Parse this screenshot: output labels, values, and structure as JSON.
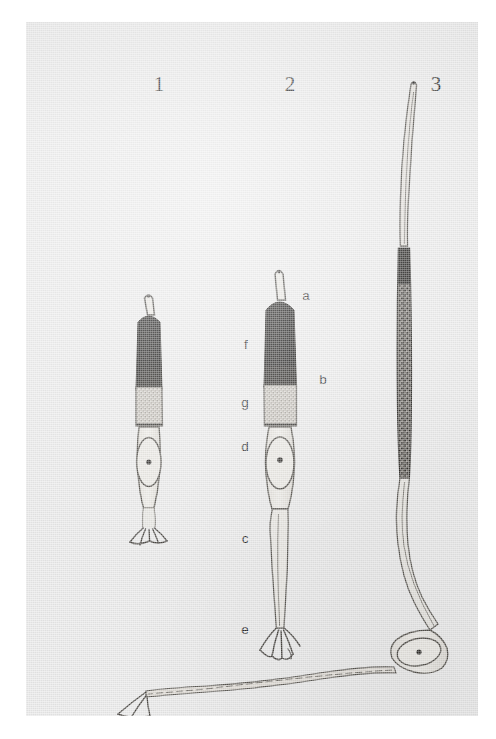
{
  "plate": {
    "background_color": "#e9e9e9",
    "page_color": "#ffffff",
    "ink_color": "#3b3a38",
    "dark_fill_color": "#1b1a18",
    "mid_fill_color": "#b9b6b0",
    "label_color": "#2a2a2a"
  },
  "figure_numbers": [
    {
      "text": "1",
      "x": 120,
      "y": 52
    },
    {
      "text": "2",
      "x": 251,
      "y": 52
    },
    {
      "text": "3",
      "x": 397,
      "y": 52
    }
  ],
  "key_labels": [
    {
      "text": "a",
      "x": 272,
      "y": 267
    },
    {
      "text": "f",
      "x": 212,
      "y": 316
    },
    {
      "text": "b",
      "x": 289,
      "y": 351
    },
    {
      "text": "g",
      "x": 211,
      "y": 374
    },
    {
      "text": "d",
      "x": 211,
      "y": 418
    },
    {
      "text": "c",
      "x": 211,
      "y": 510
    },
    {
      "text": "e",
      "x": 211,
      "y": 601
    }
  ],
  "figures": [
    {
      "id": "figure-1",
      "number": "1",
      "description": "Young spermatozoon-like cell: pointed apical spike, dark conical head, pale granular collar, oval nucleated cell body, short branched basal foot.",
      "parts": [
        "apical-spike",
        "dark-head",
        "pale-collar",
        "oval-body",
        "nucleus-dot",
        "branched-foot"
      ]
    },
    {
      "id": "figure-2",
      "number": "2",
      "description": "Fully labelled cell: apical spike (a), dark head (b) with left margin (f), pale granular collar (g), oval nucleated body (d), long slender flagellum (c), terminal branched foot (e).",
      "parts": [
        "apical-spike",
        "dark-head",
        "pale-collar",
        "oval-body",
        "nucleus-dot",
        "long-flagellum",
        "branched-foot"
      ]
    },
    {
      "id": "figure-3",
      "number": "3",
      "description": "Greatly elongated cell: long curved apical filament, very long dark granular rod-shaped body, slender curving neck, oval nucleated cell body, very long horizontal tail ending in a small branched foot.",
      "parts": [
        "apical-filament",
        "long-dark-rod",
        "curved-neck",
        "oval-body",
        "nucleus-dot",
        "long-horizontal-tail",
        "branched-foot"
      ]
    }
  ]
}
